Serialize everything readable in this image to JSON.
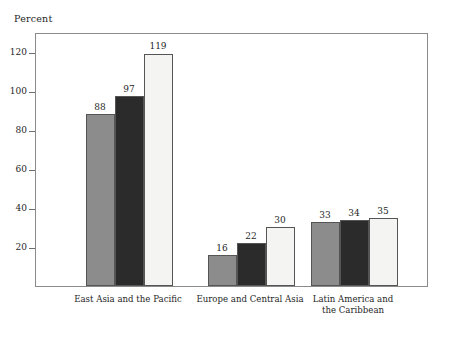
{
  "chart_data": {
    "type": "bar",
    "title": "",
    "subtitle": "",
    "xlabel": "",
    "ylabel": "Percent",
    "ylim": [
      0,
      130
    ],
    "yticks": [
      20,
      40,
      60,
      80,
      100,
      120
    ],
    "ytick_labels": [
      "20",
      "40",
      "60",
      "80",
      "100",
      "120"
    ],
    "grid": false,
    "legend_position": "top-right",
    "categories": [
      "East Asia and the Pacific",
      "Europe and Central Asia",
      "Latin America and\nthe Caribbean"
    ],
    "series": [
      {
        "name": "1995",
        "color": "#8c8c8c",
        "values": [
          88,
          16,
          33
        ]
      },
      {
        "name": "1997",
        "color": "#2b2b2b",
        "values": [
          97,
          22,
          34
        ]
      },
      {
        "name": "2001",
        "color": "#f4f4f2",
        "values": [
          119,
          30,
          35
        ]
      }
    ]
  },
  "axis": {
    "y_title": "Percent"
  },
  "legend": {
    "entries": [
      {
        "label": "1995",
        "color": "#8c8c8c"
      },
      {
        "label": "1997",
        "color": "#2b2b2b"
      },
      {
        "label": "2001",
        "color": "#f4f4f2"
      }
    ]
  }
}
